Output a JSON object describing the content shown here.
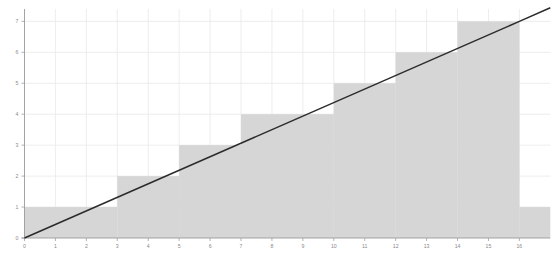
{
  "chart_data": {
    "type": "bar",
    "title": "",
    "subtitle": "",
    "xlabel": "",
    "ylabel": "",
    "xlim": [
      0,
      17
    ],
    "ylim": [
      0,
      7.4
    ],
    "xticks": [
      0,
      1,
      2,
      3,
      4,
      5,
      6,
      7,
      8,
      9,
      10,
      11,
      12,
      13,
      14,
      15,
      16
    ],
    "yticks": [
      0,
      1,
      2,
      3,
      4,
      5,
      6,
      7
    ],
    "xtick_labels": [
      "0",
      "1",
      "2",
      "3",
      "4",
      "5",
      "6",
      "7",
      "8",
      "9",
      "10",
      "11",
      "12",
      "13",
      "14",
      "15",
      "16"
    ],
    "ytick_labels": [
      "0",
      "1",
      "2",
      "3",
      "4",
      "5",
      "6",
      "7"
    ],
    "grid": true,
    "legend": null,
    "legend_position": "none",
    "series": [
      {
        "name": "step-blocks",
        "type": "bar",
        "color": "#d4d4d4",
        "blocks": [
          {
            "x_start": 0,
            "x_end": 3,
            "value": 1
          },
          {
            "x_start": 3,
            "x_end": 5,
            "value": 2
          },
          {
            "x_start": 5,
            "x_end": 7,
            "value": 3
          },
          {
            "x_start": 7,
            "x_end": 10,
            "value": 4
          },
          {
            "x_start": 10,
            "x_end": 12,
            "value": 5
          },
          {
            "x_start": 12,
            "x_end": 14,
            "value": 6
          },
          {
            "x_start": 14,
            "x_end": 16,
            "value": 7
          },
          {
            "x_start": 16,
            "x_end": 17,
            "value": 1
          }
        ]
      },
      {
        "name": "diagonal-line",
        "type": "line",
        "color": "#2b2b2b",
        "points": [
          {
            "x": 0,
            "y": 0
          },
          {
            "x": 16,
            "y": 7
          },
          {
            "x": 17,
            "y": 7.4375
          }
        ]
      }
    ]
  },
  "axes": {
    "x_axis_name": "x-axis",
    "y_axis_name": "y-axis"
  }
}
